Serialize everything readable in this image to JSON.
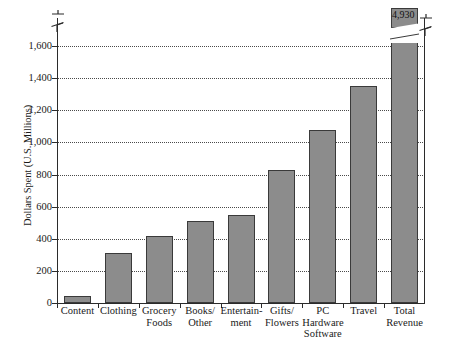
{
  "chart_data": {
    "type": "bar",
    "title": "",
    "xlabel": "",
    "ylabel": "Dollars Spent (U.S. Millions)",
    "ylim": [
      0,
      1700
    ],
    "grid": true,
    "legend": false,
    "axis_break": true,
    "axis_break_note": "Y axis is broken above 1,600; the Total Revenue bar is drawn truncated with its true value labelled.",
    "ytick_labels": [
      "0",
      "200",
      "400",
      "600",
      "800",
      "1,000",
      "1,200",
      "1,400",
      "1,600"
    ],
    "ytick_values": [
      0,
      200,
      400,
      600,
      800,
      1000,
      1200,
      1400,
      1600
    ],
    "categories": [
      "Content",
      "Clothing",
      "Grocery\nFoods",
      "Books/\nOther",
      "Entertain-\nment",
      "Gifts/\nFlowers",
      "PC\nHardware\nSoftware",
      "Travel",
      "Total\nRevenue"
    ],
    "values": [
      45,
      310,
      415,
      510,
      550,
      830,
      1080,
      1350,
      4930
    ],
    "data_labels": [
      null,
      null,
      null,
      null,
      null,
      null,
      null,
      null,
      "4,930"
    ],
    "bar_color": "#8c8c8c",
    "bar_edge_color": "#3a3a3a",
    "grid_color": "#4a4a4a",
    "axis_color": "#2b2b2b",
    "background": "#ffffff"
  },
  "icons": {
    "y_axis_break": "axis-break-icon",
    "right_axis_break": "axis-break-icon"
  }
}
